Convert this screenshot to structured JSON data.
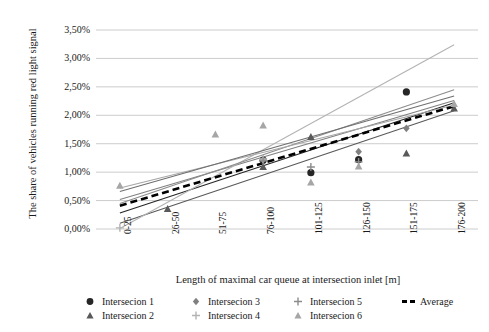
{
  "chart_data": {
    "type": "scatter",
    "title": "",
    "xlabel": "Length of maximal car queue at intersection inlet [m]",
    "ylabel": "The share of vehicles running red light signal",
    "categories": [
      "0-25",
      "26-50",
      "51-75",
      "76-100",
      "101-125",
      "126-150",
      "151-175",
      "176-200"
    ],
    "ytick_labels": [
      "0,00%",
      "0,50%",
      "1,00%",
      "1,50%",
      "2,00%",
      "2,50%",
      "3,00%",
      "3,50%"
    ],
    "ytick_values": [
      0.0,
      0.5,
      1.0,
      1.5,
      2.0,
      2.5,
      3.0,
      3.5
    ],
    "ylim": [
      0.0,
      3.5
    ],
    "grid": "horizontal",
    "legend_position": "bottom",
    "series": [
      {
        "name": "Intersecion 1",
        "marker": "circle",
        "color": "#262626",
        "points": [
          {
            "x": "76-100",
            "y": 1.21
          },
          {
            "x": "101-125",
            "y": 0.99
          },
          {
            "x": "126-150",
            "y": 1.22
          },
          {
            "x": "151-175",
            "y": 2.41
          }
        ],
        "trend": {
          "y0": 0.28,
          "y1": 2.22
        }
      },
      {
        "name": "Intersecion 2",
        "marker": "triangle",
        "color": "#595959",
        "points": [
          {
            "x": "26-50",
            "y": 0.35
          },
          {
            "x": "76-100",
            "y": 1.09
          },
          {
            "x": "101-125",
            "y": 1.62
          },
          {
            "x": "151-175",
            "y": 1.33
          },
          {
            "x": "176-200",
            "y": 2.12
          }
        ],
        "trend": {
          "y0": 0.1,
          "y1": 2.08
        }
      },
      {
        "name": "Intersecion 3",
        "marker": "diamond",
        "color": "#808080",
        "points": [
          {
            "x": "76-100",
            "y": 1.22
          },
          {
            "x": "126-150",
            "y": 1.36
          },
          {
            "x": "151-175",
            "y": 1.77
          }
        ],
        "trend": {
          "y0": 0.52,
          "y1": 2.26
        }
      },
      {
        "name": "Intersecion 4",
        "marker": "plus",
        "color": "#b3b3b3",
        "points": [
          {
            "x": "0-25",
            "y": 0.02
          },
          {
            "x": "76-100",
            "y": 1.23
          }
        ],
        "trend": {
          "y0": 0.01,
          "y1": 3.24
        }
      },
      {
        "name": "Intersecion 5",
        "marker": "plus",
        "color": "#8c8c8c",
        "points": [
          {
            "x": "76-100",
            "y": 1.2
          },
          {
            "x": "101-125",
            "y": 1.09
          },
          {
            "x": "126-150",
            "y": 1.18
          }
        ],
        "trend": {
          "y0": 0.45,
          "y1": 2.45
        }
      },
      {
        "name": "Intersecion 6",
        "marker": "triangle",
        "color": "#a6a6a6",
        "points": [
          {
            "x": "0-25",
            "y": 0.76
          },
          {
            "x": "51-75",
            "y": 1.66
          },
          {
            "x": "76-100",
            "y": 1.82
          },
          {
            "x": "101-125",
            "y": 0.82
          },
          {
            "x": "126-150",
            "y": 1.1
          },
          {
            "x": "176-200",
            "y": 2.2
          }
        ],
        "trend": {
          "y0": 0.72,
          "y1": 2.18
        }
      },
      {
        "name": "Average",
        "marker": "dashed-line",
        "color": "#000000",
        "points": [],
        "trend": {
          "y0": 0.41,
          "y1": 2.16
        }
      }
    ],
    "extra_trends": [
      {
        "name": "Intersecion 2 secondary",
        "color": "#6e6e6e",
        "y0": 0.66,
        "y1": 2.34
      }
    ]
  },
  "legend": {
    "items": [
      {
        "label": "Intersecion 1",
        "marker": "circle",
        "color": "#262626"
      },
      {
        "label": "Intersecion 2",
        "marker": "triangle",
        "color": "#595959"
      },
      {
        "label": "Intersecion 3",
        "marker": "diamond",
        "color": "#808080"
      },
      {
        "label": "Intersecion 4",
        "marker": "plus",
        "color": "#b3b3b3"
      },
      {
        "label": "Intersecion 5",
        "marker": "plus",
        "color": "#8c8c8c"
      },
      {
        "label": "Intersecion 6",
        "marker": "triangle",
        "color": "#a6a6a6"
      },
      {
        "label": "Average",
        "marker": "dashed-line",
        "color": "#000000"
      }
    ]
  }
}
